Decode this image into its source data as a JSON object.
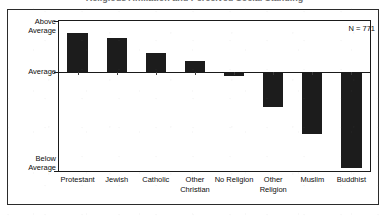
{
  "figure": {
    "clipped_title": "Religious Affiliation and Perceived Social Standing",
    "annotation": "N = 771"
  },
  "chart_data": {
    "type": "bar",
    "title": "",
    "xlabel": "",
    "ylabel": "",
    "categories": [
      "Protestant",
      "Jewish",
      "Catholic",
      "Other Christian",
      "No Religion",
      "Other Religion",
      "Muslim",
      "Buddhist"
    ],
    "category_lines": [
      [
        "Protestant"
      ],
      [
        "Jewish"
      ],
      [
        "Catholic"
      ],
      [
        "Other",
        "Christian"
      ],
      [
        "No Religion"
      ],
      [
        "Other",
        "Religion"
      ],
      [
        "Muslim"
      ],
      [
        "Buddhist"
      ]
    ],
    "values": [
      0.75,
      0.65,
      0.36,
      0.22,
      -0.04,
      -0.35,
      -0.62,
      -0.96
    ],
    "ylim": [
      -1.0,
      1.0
    ],
    "ytick_labels": [
      "Above\nAverage",
      "Average",
      "Below\nAverage"
    ],
    "ytick_values": [
      1.0,
      0.0,
      -1.0
    ],
    "grid": false,
    "legend": "none",
    "bar_color": "#1c1c1c",
    "annotations": [
      "N = 771"
    ]
  }
}
